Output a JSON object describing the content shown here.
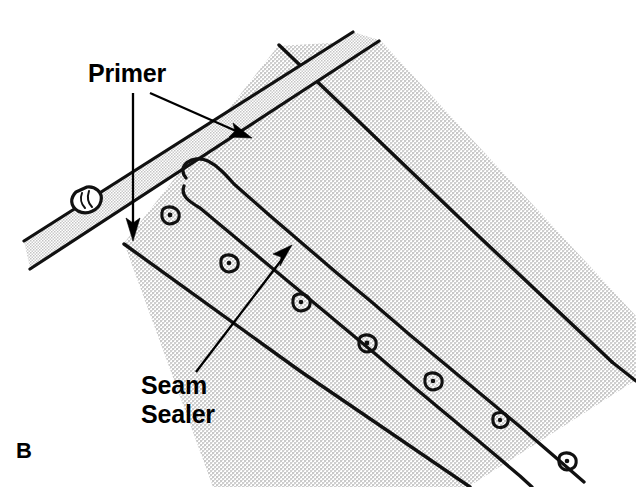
{
  "figure": {
    "marker": "B",
    "background_color": "#ffffff",
    "line_color": "#111111",
    "hatch_fill_color": "#d8d8d8"
  },
  "callouts": [
    {
      "id": "primer",
      "label": "Primer",
      "text_x": 88,
      "text_y": 82,
      "arrows": [
        {
          "name": "primer-arrow-vertical",
          "tail_x": 133,
          "tail_y": 93,
          "tip_x": 133,
          "tip_y": 239,
          "angle_deg": 90
        },
        {
          "name": "primer-arrow-diagonal",
          "tail_x": 150,
          "tail_y": 93,
          "tip_x": 250,
          "tip_y": 137,
          "angle_deg": 24
        }
      ]
    },
    {
      "id": "seam-sealer",
      "label_line1": "Seam",
      "label_line2": "Sealer",
      "text_x": 141,
      "text_y": 394,
      "arrows": [
        {
          "name": "seam-sealer-arrow",
          "tail_x": 196,
          "tail_y": 372,
          "tip_x": 290,
          "tip_y": 247,
          "angle_deg": -53
        }
      ]
    }
  ],
  "geometry": {
    "main_panel": "M 124,243 L 278,46 L 380,40 L 636,316 L 636,487 L 213,487 Z",
    "panel_edge_upper": "M 278,46 L 600,349",
    "panel_edge_lower_outer": "M 124,243 L 468,487",
    "panel_right_tip": "M 636,316 L 636,380",
    "flange_band_top": "M 22,240 L 352,33",
    "flange_band_bottom": "M 22,270 L 368,47",
    "flange_end_cap": "M 78,193 C 72,199 72,207 80,210 C 88,213 98,208 100,200 C 101,193 94,188 86,189 Z",
    "seam_bead": "M 186,176 C 178,170 192,158 204,163 C 214,167 218,172 224,178 L 268,215 L 300,243 L 340,276 L 372,300 L 404,330 L 440,358 L 470,384 L 506,412 L 540,440 L 568,464 L 590,484",
    "seam_bead_lower": "M 182,182 C 176,192 186,198 196,202 L 240,234 L 276,262 L 310,288 L 348,318 L 382,344 L 418,374 L 452,400 L 486,428 L 520,456 L 552,480"
  },
  "spot_welds": [
    {
      "cx": 169,
      "cy": 216,
      "rx": 9,
      "ry": 8
    },
    {
      "cx": 228,
      "cy": 264,
      "rx": 9,
      "ry": 7
    },
    {
      "cx": 300,
      "cy": 303,
      "rx": 9,
      "ry": 8
    },
    {
      "cx": 366,
      "cy": 344,
      "rx": 9,
      "ry": 8
    },
    {
      "cx": 432,
      "cy": 382,
      "rx": 9,
      "ry": 8
    },
    {
      "cx": 499,
      "cy": 421,
      "rx": 8,
      "ry": 7
    },
    {
      "cx": 566,
      "cy": 462,
      "rx": 9,
      "ry": 8
    },
    {
      "cx": 86,
      "cy": 200,
      "rx": 7,
      "ry": 8
    }
  ]
}
